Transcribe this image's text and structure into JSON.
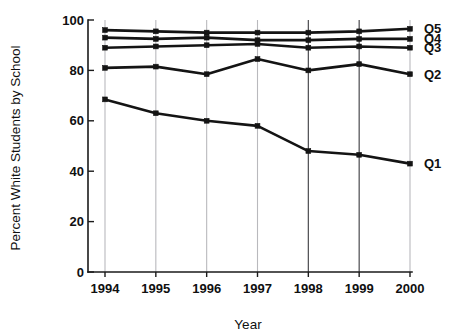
{
  "chart_data": {
    "type": "line",
    "title": "",
    "xlabel": "Year",
    "ylabel": "Percent White Students by School",
    "categories": [
      "1994",
      "1995",
      "1996",
      "1997",
      "1998",
      "1999",
      "2000"
    ],
    "x": [
      1994,
      1995,
      1996,
      1997,
      1998,
      1999,
      2000
    ],
    "xlim": [
      1994,
      2000
    ],
    "ylim": [
      0,
      100
    ],
    "yticks": [
      0,
      20,
      40,
      60,
      80,
      100
    ],
    "ytick_labels": [
      "0",
      "20",
      "40",
      "60",
      "80",
      "100"
    ],
    "xticks": [
      1994,
      1995,
      1996,
      1997,
      1998,
      1999,
      2000
    ],
    "grid": "vertical-only",
    "legend_position": "right-of-plot-inline-labels",
    "marker": "filled-square",
    "line_color": "#141414",
    "grid_color": "#b9b9bd",
    "axis_color": "#1a1a1a",
    "background": "#ffffff",
    "series": [
      {
        "name": "Q5",
        "label": "Q5",
        "values": [
          96,
          95.5,
          95,
          95,
          95,
          95.5,
          96.5
        ]
      },
      {
        "name": "Q4",
        "label": "Q4",
        "values": [
          93,
          92.5,
          93,
          92,
          92,
          92.5,
          92.5
        ]
      },
      {
        "name": "Q3",
        "label": "Q3",
        "values": [
          89,
          89.5,
          90,
          90.5,
          89,
          89.5,
          89
        ]
      },
      {
        "name": "Q2",
        "label": "Q2",
        "values": [
          81,
          81.5,
          78.5,
          84.5,
          80,
          82.5,
          78.5
        ]
      },
      {
        "name": "Q1",
        "label": "Q1",
        "values": [
          68.5,
          63,
          60,
          58,
          48,
          46.5,
          43
        ]
      }
    ]
  }
}
